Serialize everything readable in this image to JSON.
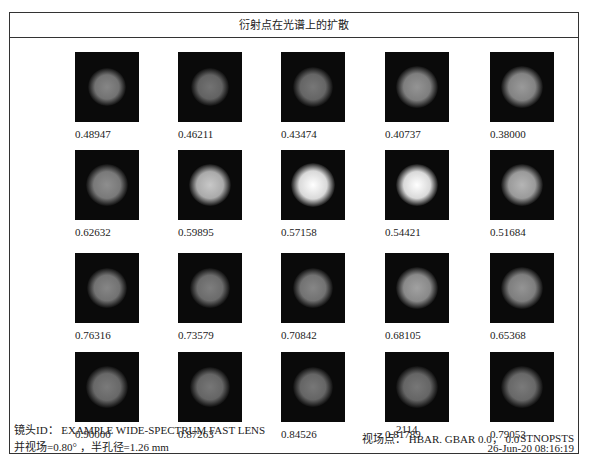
{
  "title": "衍射点在光谱上的扩散",
  "grid": {
    "rows": [
      [
        {
          "value": "0.48947",
          "brightness": 0.38,
          "size": 26
        },
        {
          "value": "0.46211",
          "brightness": 0.28,
          "size": 26
        },
        {
          "value": "0.43474",
          "brightness": 0.3,
          "size": 28
        },
        {
          "value": "0.40737",
          "brightness": 0.45,
          "size": 30
        },
        {
          "value": "0.38000",
          "brightness": 0.48,
          "size": 30
        }
      ],
      [
        {
          "value": "0.62632",
          "brightness": 0.42,
          "size": 30
        },
        {
          "value": "0.59895",
          "brightness": 0.72,
          "size": 30
        },
        {
          "value": "0.57158",
          "brightness": 1.0,
          "size": 32
        },
        {
          "value": "0.54421",
          "brightness": 1.0,
          "size": 30
        },
        {
          "value": "0.51684",
          "brightness": 0.62,
          "size": 30
        }
      ],
      [
        {
          "value": "0.76316",
          "brightness": 0.38,
          "size": 28
        },
        {
          "value": "0.73579",
          "brightness": 0.34,
          "size": 28
        },
        {
          "value": "0.70842",
          "brightness": 0.38,
          "size": 28
        },
        {
          "value": "0.68105",
          "brightness": 0.52,
          "size": 30
        },
        {
          "value": "0.65368",
          "brightness": 0.45,
          "size": 30
        }
      ],
      [
        {
          "value": "0.90000",
          "brightness": 0.32,
          "size": 30
        },
        {
          "value": "0.87263",
          "brightness": 0.3,
          "size": 28
        },
        {
          "value": "0.84526",
          "brightness": 0.3,
          "size": 28
        },
        {
          "value": "0.81789",
          "brightness": 0.3,
          "size": 30
        },
        {
          "value": "0.79053",
          "brightness": 0.32,
          "size": 30
        }
      ]
    ]
  },
  "footer": {
    "lens_id": "镜头ID： EXAMPLE WIDE-SPECTRUM FAST LENS",
    "field_info": "并视场=0.80° ，半孔径=1.26 mm",
    "number": "2114",
    "field_point": "视场点： HBAR. GBAR 0.0， 0.0",
    "program": "STNOPSTS",
    "date": "26-Jun-20 08:16:19"
  }
}
